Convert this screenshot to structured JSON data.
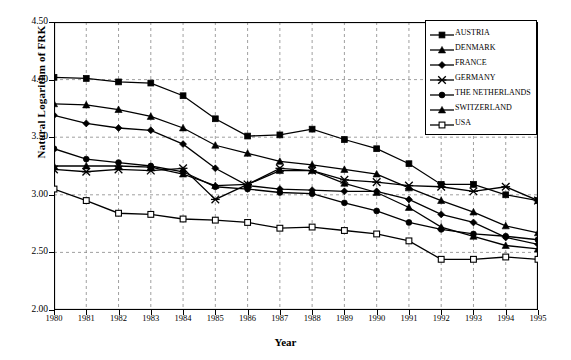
{
  "chart_data": {
    "type": "line",
    "title": "",
    "xlabel": "Year",
    "ylabel": "Natural Logarithm of FRK",
    "x": [
      1980,
      1981,
      1982,
      1983,
      1984,
      1985,
      1986,
      1987,
      1988,
      1989,
      1990,
      1991,
      1992,
      1993,
      1994,
      1995
    ],
    "xlim": [
      1980,
      1995
    ],
    "ylim": [
      2.0,
      4.5
    ],
    "yticks": [
      "4.50",
      "4.00",
      "3.50",
      "3.00",
      "2.50",
      "2.00"
    ],
    "ytick_values": [
      4.5,
      4.0,
      3.5,
      3.0,
      2.5,
      2.0
    ],
    "xticks": [
      "1980",
      "1981",
      "1982",
      "1983",
      "1984",
      "1985",
      "1986",
      "1987",
      "1988",
      "1989",
      "1990",
      "1991",
      "1992",
      "1993",
      "1994",
      "1995"
    ],
    "grid": true,
    "grid_style": "dotted",
    "legend_position": "top-right",
    "series": [
      {
        "name": "AUSTRIA",
        "marker": "filled-square",
        "color": "#000000",
        "values": [
          4.02,
          4.01,
          3.98,
          3.97,
          3.86,
          3.66,
          3.51,
          3.52,
          3.57,
          3.48,
          3.4,
          3.27,
          3.09,
          3.09,
          3.0,
          2.95
        ]
      },
      {
        "name": "DENMARK",
        "marker": "filled-triangle",
        "color": "#000000",
        "values": [
          3.79,
          3.78,
          3.74,
          3.68,
          3.58,
          3.43,
          3.36,
          3.29,
          3.26,
          3.22,
          3.18,
          3.06,
          2.95,
          2.85,
          2.73,
          2.67
        ]
      },
      {
        "name": "FRANCE",
        "marker": "filled-diamond",
        "color": "#000000",
        "values": [
          3.69,
          3.62,
          3.58,
          3.56,
          3.44,
          3.23,
          3.08,
          3.05,
          3.04,
          3.03,
          3.03,
          2.96,
          2.83,
          2.76,
          2.63,
          2.57
        ]
      },
      {
        "name": "GERMANY",
        "marker": "cross-star",
        "color": "#000000",
        "values": [
          3.22,
          3.2,
          3.22,
          3.21,
          3.23,
          2.96,
          3.09,
          3.23,
          3.21,
          3.13,
          3.11,
          3.08,
          3.07,
          3.03,
          3.07,
          2.95
        ]
      },
      {
        "name": "THE NETHERLANDS",
        "marker": "filled-circle",
        "color": "#000000",
        "values": [
          3.4,
          3.31,
          3.28,
          3.25,
          3.2,
          3.07,
          3.05,
          3.02,
          3.01,
          2.93,
          2.86,
          2.76,
          2.7,
          2.66,
          2.64,
          2.61
        ]
      },
      {
        "name": "SWITZERLAND",
        "marker": "filled-triangle",
        "color": "#000000",
        "values": [
          3.25,
          3.25,
          3.25,
          3.24,
          3.18,
          3.08,
          3.09,
          3.21,
          3.21,
          3.1,
          3.02,
          2.89,
          2.72,
          2.64,
          2.56,
          2.53
        ]
      },
      {
        "name": "USA",
        "marker": "open-square",
        "color": "#000000",
        "values": [
          3.05,
          2.95,
          2.84,
          2.83,
          2.79,
          2.78,
          2.76,
          2.71,
          2.72,
          2.69,
          2.66,
          2.6,
          2.44,
          2.44,
          2.46,
          2.44
        ]
      }
    ]
  },
  "axes": {
    "ylabel": "Natural Logarithm of FRK",
    "xlabel": "Year"
  },
  "legend": {
    "items": [
      {
        "label": "AUSTRIA"
      },
      {
        "label": "DENMARK"
      },
      {
        "label": "FRANCE"
      },
      {
        "label": "GERMANY"
      },
      {
        "label": "THE NETHERLANDS"
      },
      {
        "label": "SWITZERLAND"
      },
      {
        "label": "USA"
      }
    ]
  },
  "caption": ""
}
